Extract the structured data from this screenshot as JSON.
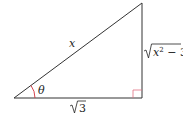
{
  "diagram": {
    "type": "right-triangle",
    "hypotenuse_label": "x",
    "angle_label": "θ",
    "adjacent_label": "3",
    "adjacent_label_full": "√3",
    "opposite_radicand_var": "x",
    "opposite_radicand_exp": "2",
    "opposite_radicand_rest": " − 3",
    "opposite_label_full": "√(x² − 3)",
    "colors": {
      "lines": "#333333",
      "angle_arc": "#d0303a",
      "right_angle_marker": "#e07080"
    }
  }
}
